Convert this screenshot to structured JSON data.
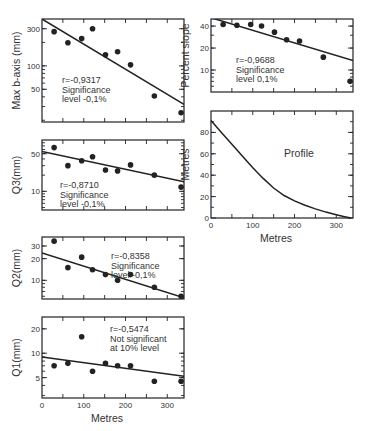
{
  "figure": {
    "x_axis_label": "Metres",
    "x_ticks": [
      0,
      100,
      200,
      300
    ]
  },
  "chart_data": [
    {
      "id": "maxb",
      "type": "scatter",
      "ylabel": "Max b-axis (mm)",
      "yscale": "log",
      "ylim": [
        19,
        400
      ],
      "xlim": [
        0,
        340
      ],
      "y_ticks": [
        50,
        100,
        300
      ],
      "x": [
        29,
        62,
        95,
        121,
        152,
        181,
        212,
        269,
        333
      ],
      "y": [
        275,
        198,
        224,
        300,
        139,
        152,
        103,
        41,
        25
      ],
      "fit": {
        "x0": 0,
        "y0": 400,
        "x1": 340,
        "y1": 32
      },
      "annotation": [
        "r=-0,9317",
        "Significance",
        "level -0,1%"
      ]
    },
    {
      "id": "slope",
      "type": "scatter",
      "ylabel": "Percent slope",
      "yscale": "log",
      "ylim": [
        5,
        50
      ],
      "xlim": [
        0,
        340
      ],
      "y_ticks": [
        10,
        20,
        40
      ],
      "x": [
        29,
        62,
        95,
        121,
        152,
        181,
        212,
        269,
        333
      ],
      "y": [
        42,
        41,
        42,
        40,
        33,
        26,
        25,
        15,
        7
      ],
      "fit": {
        "x0": 0,
        "y0": 52,
        "x1": 340,
        "y1": 13.5
      },
      "annotation": [
        "r=-0,9688",
        "Significance",
        "level 0,1%"
      ]
    },
    {
      "id": "q3",
      "type": "scatter",
      "ylabel": "Q3(mm)",
      "yscale": "log",
      "ylim": [
        4.5,
        90
      ],
      "xlim": [
        0,
        340
      ],
      "y_ticks": [
        10,
        50
      ],
      "x": [
        29,
        62,
        95,
        121,
        152,
        181,
        212,
        269,
        333
      ],
      "y": [
        65,
        30,
        37,
        44,
        25,
        24,
        31,
        20,
        12
      ],
      "fit": {
        "x0": 0,
        "y0": 55,
        "x1": 340,
        "y1": 15
      },
      "annotation": [
        "r=-0,8710",
        "Significance",
        "level -0,1%"
      ]
    },
    {
      "id": "q2",
      "type": "scatter",
      "ylabel": "Q2(mm)",
      "yscale": "log",
      "ylim": [
        5.5,
        40
      ],
      "xlim": [
        0,
        340
      ],
      "y_ticks": [
        10,
        20,
        30
      ],
      "x": [
        29,
        62,
        95,
        121,
        152,
        181,
        212,
        269,
        333
      ],
      "y": [
        35,
        15,
        21,
        14,
        12,
        10,
        12,
        8,
        6
      ],
      "fit": {
        "x0": 0,
        "y0": 24,
        "x1": 340,
        "y1": 5.7
      },
      "annotation": [
        "r=-0,8358",
        "Significance",
        "level -0,1%"
      ]
    },
    {
      "id": "q1",
      "type": "scatter",
      "ylabel": "Q1(mm)",
      "yscale": "log",
      "ylim": [
        2.8,
        28
      ],
      "xlim": [
        0,
        340
      ],
      "y_ticks": [
        5,
        10,
        20
      ],
      "x": [
        29,
        62,
        95,
        121,
        152,
        181,
        212,
        269,
        333
      ],
      "y": [
        7,
        7.5,
        16,
        6,
        7.5,
        7,
        7,
        4.5,
        4.5
      ],
      "fit": {
        "x0": 0,
        "y0": 9,
        "x1": 340,
        "y1": 5.2
      },
      "annotation": [
        "r=-0,5474",
        "Not significant",
        "at 10% level"
      ],
      "xlabel": "Metres"
    },
    {
      "id": "profile",
      "type": "line",
      "title": "Profile",
      "ylabel": "Metres",
      "xlabel": "Metres",
      "yscale": "linear",
      "ylim": [
        0,
        100
      ],
      "xlim": [
        0,
        340
      ],
      "y_ticks": [
        0,
        20,
        40,
        60,
        80
      ],
      "x": [
        0,
        25,
        50,
        75,
        100,
        125,
        150,
        175,
        200,
        225,
        250,
        275,
        300,
        320,
        335
      ],
      "y": [
        91,
        80,
        69,
        58,
        47,
        37,
        28,
        21,
        16,
        12,
        8.5,
        5.5,
        3,
        1.2,
        0
      ]
    }
  ]
}
